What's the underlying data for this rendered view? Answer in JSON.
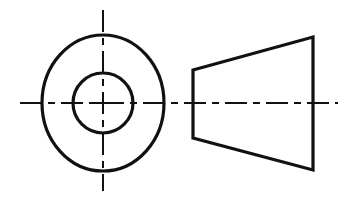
{
  "drawing": {
    "title": "Orthographic engineering drawing - truncated cone (frustum) with central bore",
    "canvas": {
      "width": 349,
      "height": 199,
      "background": "#ffffff"
    },
    "style": {
      "object_line_color": "#111111",
      "object_line_width": 3.2,
      "center_line_color": "#111111",
      "center_line_width": 2.0,
      "center_line_dash": "22 6 7 6"
    },
    "views": {
      "front_view": {
        "label": "front-view-concentric-circles",
        "center": {
          "x": 103,
          "y": 103
        },
        "outer_circle": {
          "cx": 103,
          "cy": 103,
          "rx": 61,
          "ry": 68
        },
        "inner_circle": {
          "cx": 103,
          "cy": 103,
          "rx": 30,
          "ry": 30
        },
        "vertical_centerline": {
          "x": 103,
          "y1": 10,
          "y2": 191
        }
      },
      "side_view": {
        "label": "side-view-trapezoid-frustum",
        "trapezoid_points": "193,70 313,37 313,170 193,138",
        "left_edge": {
          "x": 193,
          "y1": 70,
          "y2": 138
        },
        "right_edge": {
          "x": 313,
          "y1": 37,
          "y2": 170
        },
        "top_edge": {
          "x1": 193,
          "y1": 70,
          "x2": 313,
          "y2": 37
        },
        "bottom_edge": {
          "x1": 193,
          "y1": 138,
          "x2": 313,
          "y2": 170
        }
      }
    },
    "horizontal_centerline": {
      "x1": 20,
      "x2": 338,
      "y": 103
    },
    "center_cross": {
      "cx": 103,
      "cy": 103,
      "arm": 9
    }
  },
  "chart_data": {
    "type": "diagram",
    "elements": [
      {
        "name": "outer-circle",
        "shape": "circle",
        "cx": 103,
        "cy": 103,
        "rx": 61,
        "ry": 68
      },
      {
        "name": "inner-circle",
        "shape": "circle",
        "cx": 103,
        "cy": 103,
        "rx": 30,
        "ry": 30
      },
      {
        "name": "vertical-centerline",
        "shape": "dash-dot-line",
        "x1": 103,
        "y1": 10,
        "x2": 103,
        "y2": 191
      },
      {
        "name": "horizontal-centerline",
        "shape": "dash-dot-line",
        "x1": 20,
        "y1": 103,
        "x2": 338,
        "y2": 103
      },
      {
        "name": "trapezoid",
        "shape": "polygon",
        "points": "193,70 313,37 313,170 193,138"
      }
    ],
    "xlabel": "",
    "ylabel": "",
    "legend": []
  }
}
